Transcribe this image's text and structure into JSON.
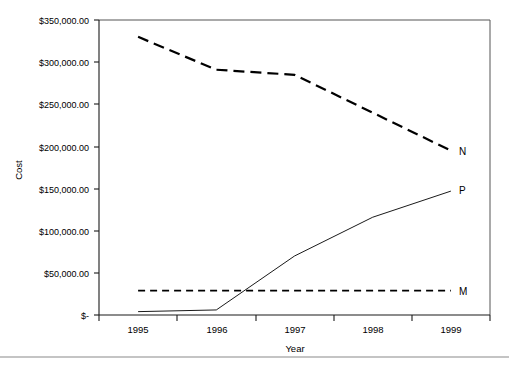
{
  "chart_data": {
    "type": "line",
    "title": "",
    "xlabel": "Year",
    "ylabel": "Cost",
    "categories": [
      "1995",
      "1996",
      "1997",
      "1998",
      "1999"
    ],
    "ylim": [
      0,
      350000
    ],
    "ytick_values": [
      0,
      50000,
      100000,
      150000,
      200000,
      250000,
      300000,
      350000
    ],
    "ytick_labels": [
      "$-",
      "$50,000.00",
      "$100,000.00",
      "$150,000.00",
      "$200,000.00",
      "$250,000.00",
      "$300,000.00",
      "$350,000.00"
    ],
    "grid": false,
    "legend_position": "right-of-line-ends",
    "series": [
      {
        "name": "N",
        "label": "N",
        "style": "long-dashed",
        "color": "#000000",
        "values": [
          330000,
          291000,
          285000,
          240000,
          195000
        ]
      },
      {
        "name": "P",
        "label": "P",
        "style": "solid-thin",
        "color": "#000000",
        "values": [
          4000,
          6000,
          70000,
          116000,
          147000
        ]
      },
      {
        "name": "M",
        "label": "M",
        "style": "short-dashed",
        "color": "#000000",
        "values": [
          29000,
          29000,
          29000,
          29000,
          29000
        ]
      }
    ]
  },
  "axes": {
    "y_title": "Cost",
    "x_title": "Year",
    "y_labels": {
      "t350000": "$350,000.00",
      "t300000": "$300,000.00",
      "t250000": "$250,000.00",
      "t200000": "$200,000.00",
      "t150000": "$150,000.00",
      "t100000": "$100,000.00",
      "t50000": "$50,000.00",
      "t0": "$-"
    },
    "x_labels": {
      "c1995": "1995",
      "c1996": "1996",
      "c1997": "1997",
      "c1998": "1998",
      "c1999": "1999"
    }
  },
  "series_labels": {
    "n": "N",
    "p": "P",
    "m": "M"
  }
}
